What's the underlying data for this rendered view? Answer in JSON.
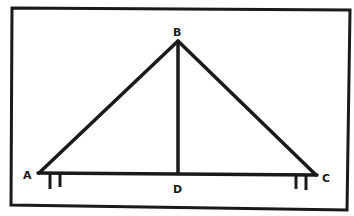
{
  "diagram": {
    "type": "roof-truss",
    "colors": {
      "ink": "#1a1a1a",
      "background": "#ffffff"
    },
    "points": {
      "A": {
        "label": "A",
        "x": 38,
        "y": 173
      },
      "B": {
        "label": "B",
        "x": 178,
        "y": 41
      },
      "C": {
        "label": "C",
        "x": 316,
        "y": 175
      },
      "D": {
        "label": "D",
        "x": 178,
        "y": 174
      }
    },
    "members": [
      "AB",
      "BC",
      "AC",
      "BD"
    ],
    "supports": [
      "A",
      "C"
    ]
  }
}
